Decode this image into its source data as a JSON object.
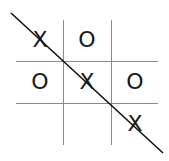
{
  "board": {
    "cells": [
      [
        "X",
        "O",
        ""
      ],
      [
        "O",
        "X",
        "O"
      ],
      [
        "",
        "",
        "X"
      ]
    ],
    "winner": "X",
    "winning_line": "diagonal-top-left-to-bottom-right"
  },
  "colors": {
    "grid": "#8a8a8a",
    "mark": "#1a1a1a",
    "strike": "#111111"
  }
}
